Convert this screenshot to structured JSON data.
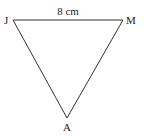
{
  "diagram": {
    "type": "triangle",
    "vertices": [
      {
        "label": "J",
        "x": 13,
        "y": 20
      },
      {
        "label": "M",
        "x": 123,
        "y": 20
      },
      {
        "label": "A",
        "x": 67,
        "y": 118
      }
    ],
    "side_labels": {
      "JM": "8 cm"
    },
    "stroke_color": "#333333"
  }
}
